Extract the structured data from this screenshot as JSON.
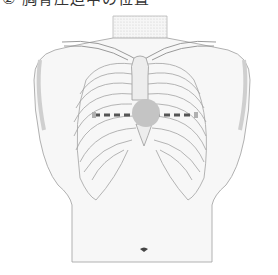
{
  "caption": {
    "text": "② 胸骨圧迫中の位置"
  },
  "figure": {
    "marker": {
      "shape": "circle",
      "label": "compression-point",
      "color": "#c4c4c4",
      "center": [
        146,
        113
      ],
      "radius": 14
    },
    "guide_line": {
      "style": "dashed",
      "color": "#555555",
      "from": [
        94,
        115
      ],
      "to": [
        196,
        115
      ]
    },
    "colors": {
      "outline": "#9a9a9a",
      "shade": "#e6e6e6",
      "skin": "#f4f4f4",
      "navel": "#444444"
    }
  }
}
